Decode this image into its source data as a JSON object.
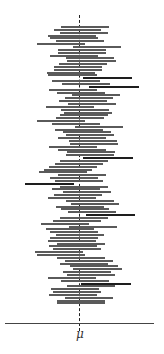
{
  "chart_data": {
    "type": "interval",
    "title": "",
    "xlabel": "μ",
    "ylabel": "",
    "reference_line": {
      "label": "μ",
      "x": 0,
      "style": "dashed"
    },
    "x_axis_ticks": [
      {
        "value": 0,
        "label": "μ"
      }
    ],
    "xlim": [
      -74,
      75
    ],
    "grid": false,
    "legend": null,
    "intervals": [
      {
        "lower": -18,
        "upper": 30,
        "miss": false
      },
      {
        "lower": -25,
        "upper": 22,
        "miss": false
      },
      {
        "lower": -19,
        "upper": 29,
        "miss": false
      },
      {
        "lower": -31,
        "upper": 17,
        "miss": false
      },
      {
        "lower": -29,
        "upper": 19,
        "miss": false
      },
      {
        "lower": -23,
        "upper": 25,
        "miss": false
      },
      {
        "lower": -42,
        "upper": 6,
        "miss": false
      },
      {
        "lower": -6,
        "upper": 42,
        "miss": false
      },
      {
        "lower": -21,
        "upper": 27,
        "miss": false
      },
      {
        "lower": -21,
        "upper": 27,
        "miss": false
      },
      {
        "lower": -29,
        "upper": 19,
        "miss": false
      },
      {
        "lower": -13,
        "upper": 35,
        "miss": false
      },
      {
        "lower": -12,
        "upper": 37,
        "miss": false
      },
      {
        "lower": -20,
        "upper": 28,
        "miss": false
      },
      {
        "lower": -25,
        "upper": 23,
        "miss": false
      },
      {
        "lower": -25,
        "upper": 23,
        "miss": false
      },
      {
        "lower": -32,
        "upper": 16,
        "miss": false
      },
      {
        "lower": -31,
        "upper": 18,
        "miss": false
      },
      {
        "lower": 4,
        "upper": 53,
        "miss": true
      },
      {
        "lower": -27,
        "upper": 21,
        "miss": false
      },
      {
        "lower": -17,
        "upper": 31,
        "miss": false
      },
      {
        "lower": 10,
        "upper": 60,
        "miss": true
      },
      {
        "lower": -30,
        "upper": 18,
        "miss": false
      },
      {
        "lower": -22,
        "upper": 26,
        "miss": false
      },
      {
        "lower": -7,
        "upper": 41,
        "miss": false
      },
      {
        "lower": -14,
        "upper": 34,
        "miss": false
      },
      {
        "lower": -20,
        "upper": 28,
        "miss": false
      },
      {
        "lower": -11,
        "upper": 37,
        "miss": false
      },
      {
        "lower": -33,
        "upper": 15,
        "miss": false
      },
      {
        "lower": -18,
        "upper": 30,
        "miss": false
      },
      {
        "lower": -15,
        "upper": 33,
        "miss": false
      },
      {
        "lower": -19,
        "upper": 29,
        "miss": false
      },
      {
        "lower": -23,
        "upper": 25,
        "miss": false
      },
      {
        "lower": -42,
        "upper": 6,
        "miss": false
      },
      {
        "lower": -27,
        "upper": 21,
        "miss": false
      },
      {
        "lower": -4,
        "upper": 44,
        "miss": false
      },
      {
        "lower": -24,
        "upper": 24,
        "miss": false
      },
      {
        "lower": -16,
        "upper": 32,
        "miss": false
      },
      {
        "lower": -13,
        "upper": 35,
        "miss": false
      },
      {
        "lower": -21,
        "upper": 27,
        "miss": false
      },
      {
        "lower": -10,
        "upper": 38,
        "miss": false
      },
      {
        "lower": -9,
        "upper": 39,
        "miss": false
      },
      {
        "lower": -30,
        "upper": 18,
        "miss": false
      },
      {
        "lower": -21,
        "upper": 27,
        "miss": false
      },
      {
        "lower": -12,
        "upper": 36,
        "miss": false
      },
      {
        "lower": -13,
        "upper": 35,
        "miss": false
      },
      {
        "lower": 4,
        "upper": 54,
        "miss": true
      },
      {
        "lower": -19,
        "upper": 29,
        "miss": false
      },
      {
        "lower": -24,
        "upper": 24,
        "miss": false
      },
      {
        "lower": -30,
        "upper": 18,
        "miss": false
      },
      {
        "lower": -35,
        "upper": 13,
        "miss": false
      },
      {
        "lower": -40,
        "upper": 8,
        "miss": false
      },
      {
        "lower": -21,
        "upper": 27,
        "miss": false
      },
      {
        "lower": -29,
        "upper": 19,
        "miss": false
      },
      {
        "lower": -24,
        "upper": 24,
        "miss": false
      },
      {
        "lower": -54,
        "upper": -5,
        "miss": true
      },
      {
        "lower": -19,
        "upper": 29,
        "miss": false
      },
      {
        "lower": -27,
        "upper": 21,
        "miss": false
      },
      {
        "lower": -16,
        "upper": 32,
        "miss": false
      },
      {
        "lower": -25,
        "upper": 23,
        "miss": false
      },
      {
        "lower": -31,
        "upper": 17,
        "miss": false
      },
      {
        "lower": -13,
        "upper": 35,
        "miss": false
      },
      {
        "lower": -8,
        "upper": 40,
        "miss": false
      },
      {
        "lower": -23,
        "upper": 25,
        "miss": false
      },
      {
        "lower": -18,
        "upper": 30,
        "miss": false
      },
      {
        "lower": -11,
        "upper": 37,
        "miss": false
      },
      {
        "lower": 7,
        "upper": 56,
        "miss": true
      },
      {
        "lower": -19,
        "upper": 29,
        "miss": false
      },
      {
        "lower": -26,
        "upper": 22,
        "miss": false
      },
      {
        "lower": -38,
        "upper": 10,
        "miss": false
      },
      {
        "lower": -10,
        "upper": 38,
        "miss": false
      },
      {
        "lower": -33,
        "upper": 15,
        "miss": false
      },
      {
        "lower": -29,
        "upper": 19,
        "miss": false
      },
      {
        "lower": -23,
        "upper": 25,
        "miss": false
      },
      {
        "lower": -29,
        "upper": 19,
        "miss": false
      },
      {
        "lower": -31,
        "upper": 17,
        "miss": false
      },
      {
        "lower": -22,
        "upper": 26,
        "miss": false
      },
      {
        "lower": -30,
        "upper": 18,
        "miss": false
      },
      {
        "lower": -26,
        "upper": 22,
        "miss": false
      },
      {
        "lower": -44,
        "upper": 4,
        "miss": false
      },
      {
        "lower": -42,
        "upper": 6,
        "miss": false
      },
      {
        "lower": -22,
        "upper": 26,
        "miss": false
      },
      {
        "lower": -14,
        "upper": 34,
        "miss": false
      },
      {
        "lower": -19,
        "upper": 29,
        "miss": false
      },
      {
        "lower": -9,
        "upper": 39,
        "miss": false
      },
      {
        "lower": -6,
        "upper": 43,
        "miss": false
      },
      {
        "lower": -16,
        "upper": 32,
        "miss": false
      },
      {
        "lower": -12,
        "upper": 36,
        "miss": false
      },
      {
        "lower": -31,
        "upper": 17,
        "miss": false
      },
      {
        "lower": -18,
        "upper": 30,
        "miss": false
      },
      {
        "lower": 2,
        "upper": 52,
        "miss": true
      },
      {
        "lower": -12,
        "upper": 36,
        "miss": false
      },
      {
        "lower": -28,
        "upper": 20,
        "miss": false
      },
      {
        "lower": -26,
        "upper": 22,
        "miss": false
      },
      {
        "lower": -30,
        "upper": 18,
        "miss": false
      },
      {
        "lower": -14,
        "upper": 34,
        "miss": false
      },
      {
        "lower": -22,
        "upper": 26,
        "miss": false
      },
      {
        "lower": -22,
        "upper": 26,
        "miss": false
      }
    ],
    "layout": {
      "mu_px": 79,
      "first_row_y": 26,
      "row_spacing": 2.85
    }
  },
  "labels": {
    "mu": "μ"
  }
}
